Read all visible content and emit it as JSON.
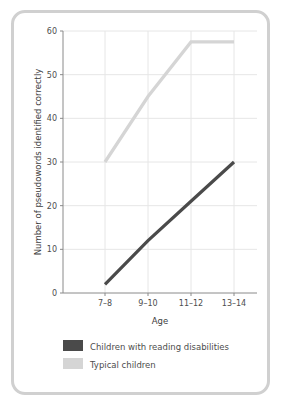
{
  "figure": {
    "border_color": "#d0d0d0",
    "background": "#ffffff"
  },
  "chart_data": {
    "type": "line",
    "title": "",
    "subtitle": "",
    "xlabel": "Age",
    "ylabel": "Number of pseudowords identified correctly",
    "categories": [
      "7–8",
      "9–10",
      "11–12",
      "13–14"
    ],
    "ytick_labels": [
      "0",
      "10",
      "20",
      "30",
      "40",
      "50",
      "60"
    ],
    "ytick_values": [
      0,
      10,
      20,
      30,
      40,
      50,
      60
    ],
    "ylim": [
      0,
      60
    ],
    "grid": "both",
    "legend_position": "below",
    "series": [
      {
        "name": "Children with reading disabilities",
        "color": "#4a4a4a",
        "values": [
          2,
          12,
          21,
          30
        ]
      },
      {
        "name": "Typical children",
        "color": "#d5d5d5",
        "values": [
          30,
          45,
          57.5,
          57.5
        ]
      }
    ]
  },
  "legend": {
    "items": [
      {
        "label": "Children with reading disabilities",
        "color": "#4a4a4a"
      },
      {
        "label": "Typical children",
        "color": "#d5d5d5"
      }
    ]
  }
}
